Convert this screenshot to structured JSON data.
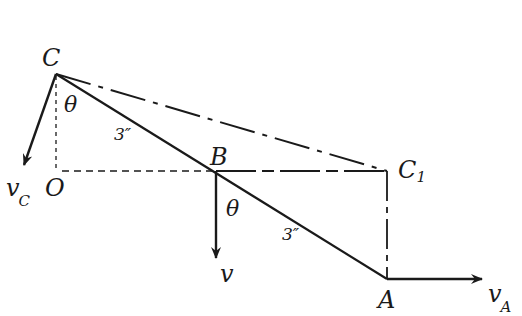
{
  "diagram": {
    "points": {
      "C": {
        "label": "C",
        "x": 56,
        "y": 74
      },
      "O": {
        "label": "O",
        "x": 56,
        "y": 171
      },
      "B": {
        "label": "B",
        "x": 216,
        "y": 171
      },
      "C1": {
        "label": "C",
        "sub": "1",
        "x": 387,
        "y": 171
      },
      "A": {
        "label": "A",
        "x": 387,
        "y": 279
      }
    },
    "segments": {
      "CB_length": "3″",
      "BA_length": "3″"
    },
    "angles": {
      "theta_C": "θ",
      "theta_B": "θ"
    },
    "vectors": {
      "vC": {
        "label": "v",
        "sub": "C"
      },
      "vB": {
        "label": "v"
      },
      "vA": {
        "label": "v",
        "sub": "A"
      }
    },
    "colors": {
      "stroke": "#1a1a1a",
      "background": "#ffffff"
    }
  }
}
